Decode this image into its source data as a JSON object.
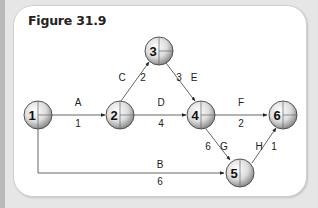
{
  "figure": {
    "title": "Figure 31.9"
  },
  "nodes": [
    {
      "id": "1",
      "label": "1"
    },
    {
      "id": "2",
      "label": "2"
    },
    {
      "id": "3",
      "label": "3"
    },
    {
      "id": "4",
      "label": "4"
    },
    {
      "id": "5",
      "label": "5"
    },
    {
      "id": "6",
      "label": "6"
    }
  ],
  "activities": [
    {
      "name": "A",
      "duration": "1",
      "from": "1",
      "to": "2"
    },
    {
      "name": "B",
      "duration": "6",
      "from": "1",
      "to": "5"
    },
    {
      "name": "C",
      "duration": "2",
      "from": "2",
      "to": "3"
    },
    {
      "name": "D",
      "duration": "4",
      "from": "2",
      "to": "4"
    },
    {
      "name": "E",
      "duration": "3",
      "from": "3",
      "to": "4"
    },
    {
      "name": "F",
      "duration": "2",
      "from": "4",
      "to": "6"
    },
    {
      "name": "G",
      "duration": "6",
      "from": "4",
      "to": "5"
    },
    {
      "name": "H",
      "duration": "1",
      "from": "5",
      "to": "6"
    }
  ],
  "colors": {
    "background": "#e6e6e6",
    "panel": "#ffffff",
    "line": "#555555",
    "node_fill_light": "#ffffff",
    "node_fill_dark": "#8a8a8a"
  }
}
